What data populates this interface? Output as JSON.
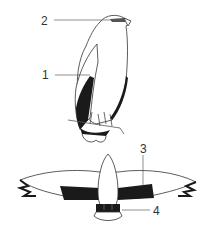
{
  "figure": {
    "colors": {
      "ink": "#1a1a1a",
      "line": "#444444",
      "paper": "#ffffff",
      "label": "#333333"
    }
  },
  "callouts": [
    {
      "id": "1",
      "label": "1",
      "x": 42,
      "y": 69
    },
    {
      "id": "2",
      "label": "2",
      "x": 41,
      "y": 15
    },
    {
      "id": "3",
      "label": "3",
      "x": 140,
      "y": 143
    },
    {
      "id": "4",
      "label": "4",
      "x": 153,
      "y": 205
    }
  ]
}
